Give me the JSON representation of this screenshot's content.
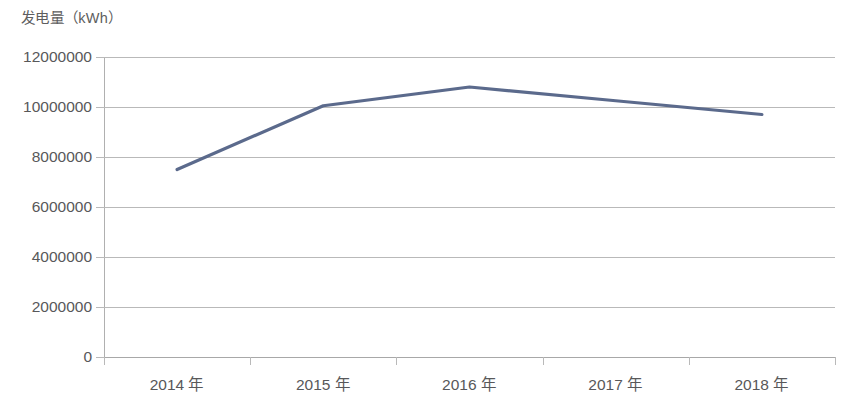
{
  "chart_data": {
    "type": "line",
    "title": "发电量（kWh）",
    "xlabel": "",
    "ylabel": "发电量（kWh）",
    "categories": [
      "2014 年",
      "2015 年",
      "2016 年",
      "2017 年",
      "2018 年"
    ],
    "series": [
      {
        "name": "发电量",
        "values": [
          7500000,
          10050000,
          10800000,
          10250000,
          9700000
        ]
      }
    ],
    "ylim": [
      0,
      12000000
    ],
    "ytick_values": [
      12000000,
      10000000,
      8000000,
      6000000,
      4000000,
      2000000,
      0
    ],
    "ytick_labels": [
      "12000000",
      "10000000",
      "8000000",
      "6000000",
      "4000000",
      "2000000",
      "0"
    ],
    "grid": true,
    "grid_axis": "y",
    "legend": false,
    "legend_position": "none",
    "markers": false,
    "line_color": "#5b6a8c",
    "grid_color": "#b9b9b9",
    "text_color": "#58585a",
    "background_color": "#ffffff"
  }
}
